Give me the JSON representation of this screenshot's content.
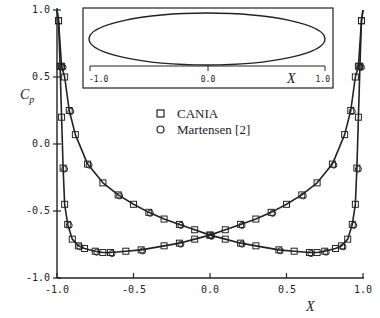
{
  "chart_data": {
    "type": "line",
    "title": "",
    "xlabel": "X",
    "ylabel": "C_p",
    "xlim": [
      -1.0,
      1.0
    ],
    "ylim": [
      -1.0,
      1.0
    ],
    "xticks": [
      "-1.0",
      "-0.5",
      "0.0",
      "0.5",
      "1.0"
    ],
    "yticks": [
      "1.0",
      "0.5",
      "0.0",
      "-0.5",
      "-1.0"
    ],
    "grid": false,
    "legend_position": "upper-center",
    "legend": [
      {
        "name": "CANIA",
        "marker": "square"
      },
      {
        "name": "Martensen [2]",
        "marker": "circle"
      }
    ],
    "series": [
      {
        "name": "Surface 1 (steep at leading edge x=-1)",
        "x": [
          -1.0,
          -0.99,
          -0.98,
          -0.97,
          -0.96,
          -0.95,
          -0.93,
          -0.9,
          -0.86,
          -0.82,
          -0.75,
          -0.7,
          -0.65,
          -0.55,
          -0.45,
          -0.3,
          -0.2,
          -0.1,
          0.0,
          0.1,
          0.2,
          0.3,
          0.4,
          0.5,
          0.6,
          0.7,
          0.8,
          0.88,
          0.92,
          0.95,
          0.97,
          0.99,
          1.0
        ],
        "y": [
          1.0,
          0.92,
          0.58,
          0.2,
          -0.18,
          -0.45,
          -0.6,
          -0.71,
          -0.76,
          -0.78,
          -0.8,
          -0.81,
          -0.81,
          -0.8,
          -0.79,
          -0.76,
          -0.74,
          -0.71,
          -0.68,
          -0.64,
          -0.6,
          -0.56,
          -0.51,
          -0.45,
          -0.38,
          -0.29,
          -0.15,
          0.07,
          0.25,
          0.5,
          0.58,
          0.92,
          1.0
        ]
      },
      {
        "name": "Surface 2 (steep at trailing edge x=1)",
        "x": [
          -1.0,
          -0.99,
          -0.97,
          -0.95,
          -0.92,
          -0.88,
          -0.8,
          -0.7,
          -0.6,
          -0.5,
          -0.4,
          -0.3,
          -0.2,
          -0.1,
          0.0,
          0.1,
          0.2,
          0.3,
          0.45,
          0.55,
          0.65,
          0.7,
          0.75,
          0.82,
          0.86,
          0.9,
          0.93,
          0.95,
          0.96,
          0.97,
          0.98,
          0.99,
          1.0
        ],
        "y": [
          1.0,
          0.92,
          0.58,
          0.5,
          0.25,
          0.07,
          -0.15,
          -0.29,
          -0.38,
          -0.45,
          -0.51,
          -0.56,
          -0.6,
          -0.64,
          -0.68,
          -0.71,
          -0.74,
          -0.76,
          -0.79,
          -0.8,
          -0.81,
          -0.81,
          -0.8,
          -0.78,
          -0.76,
          -0.71,
          -0.6,
          -0.45,
          -0.18,
          0.2,
          0.58,
          0.92,
          1.0
        ]
      }
    ],
    "inset": {
      "description": "Elliptical airfoil section",
      "xlabel": "X",
      "xticks": [
        "-1.0",
        "0.0",
        "1.0"
      ],
      "shape": "ellipse",
      "x_range": [
        -1.0,
        1.0
      ]
    }
  },
  "labels": {
    "ylabel_main": "C",
    "ylabel_sub": "p",
    "xlabel": "X",
    "legend_cania": "CANIA",
    "legend_martensen": "Martensen  [2]",
    "inset_xlabel": "X",
    "inset_tick_m1": "-1.0",
    "inset_tick_0": "0.0",
    "inset_tick_p1": "1.0",
    "xt0": "-1.0",
    "xt1": "-0.5",
    "xt2": "0.0",
    "xt3": "0.5",
    "xt4": "1.0",
    "yt0": "1.0",
    "yt1": "0.5",
    "yt2": "0.0",
    "yt3": "-0.5",
    "yt4": "-1.0"
  }
}
